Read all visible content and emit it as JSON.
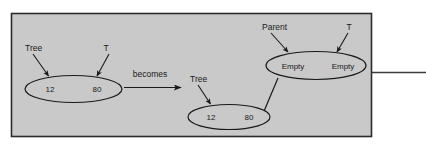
{
  "figure": {
    "kind": "tree-insertion-diagram",
    "panel": {
      "background_color": "#c9c9c9",
      "border_color": "#2b2b2b"
    },
    "ink_color": "#1a1a1a"
  },
  "before": {
    "pointer_labels": {
      "tree": "Tree",
      "t": "T"
    },
    "node": {
      "left_value": "12",
      "right_value": "80"
    }
  },
  "transition": {
    "label": "becomes"
  },
  "after": {
    "pointer_labels": {
      "tree": "Tree",
      "parent": "Parent",
      "t": "T"
    },
    "root_node": {
      "left_value": "12",
      "right_value": "80"
    },
    "child_node": {
      "left_value": "Empty",
      "right_value": "Empty"
    }
  },
  "rule": {
    "present": "true"
  }
}
